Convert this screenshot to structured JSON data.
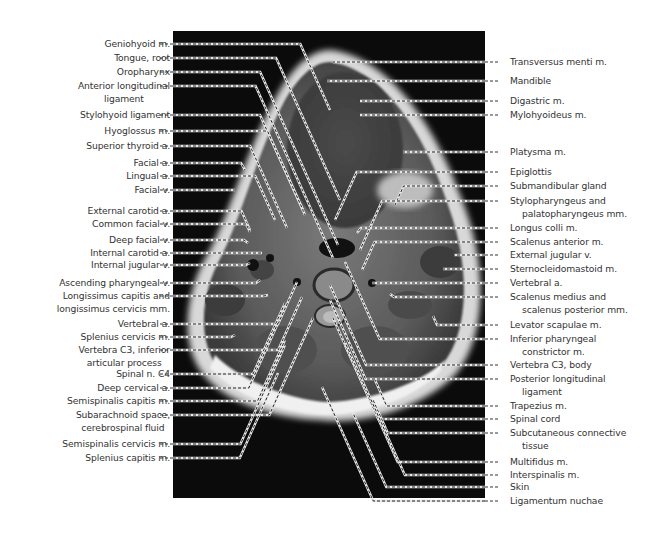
{
  "figure": {
    "colors": {
      "background": "#ffffff",
      "scan_bg": "#0b0b0b",
      "label_text": "#333333",
      "leader_dark": "#222222",
      "leader_light": "#e8e8e8"
    }
  },
  "labels_left": [
    {
      "text": "Geniohyoid m.",
      "line2": "",
      "y": 44,
      "tx": 330,
      "ty": 110
    },
    {
      "text": "Tongue, root",
      "line2": "",
      "y": 58,
      "tx": 340,
      "ty": 200
    },
    {
      "text": "Oropharynx",
      "line2": "",
      "y": 72,
      "tx": 338,
      "ty": 245
    },
    {
      "text": "Anterior longitudinal",
      "line2": "ligament",
      "y": 86,
      "tx": 333,
      "ty": 258
    },
    {
      "text": "Stylohyoid ligament",
      "line2": "",
      "y": 115,
      "tx": 305,
      "ty": 215
    },
    {
      "text": "Hyoglossus m.",
      "line2": "",
      "y": 131,
      "tx": 303,
      "ty": 210
    },
    {
      "text": "Superior thyroid a.",
      "line2": "",
      "y": 146,
      "tx": 287,
      "ty": 228
    },
    {
      "text": "Facial a.",
      "line2": "",
      "y": 163,
      "tx": 245,
      "ty": 170
    },
    {
      "text": "Lingual a.",
      "line2": "",
      "y": 176,
      "tx": 275,
      "ty": 220
    },
    {
      "text": "Facial v.",
      "line2": "",
      "y": 190,
      "tx": 235,
      "ty": 190
    },
    {
      "text": "External carotid a.",
      "line2": "",
      "y": 211,
      "tx": 250,
      "ty": 230
    },
    {
      "text": "Common facial v.",
      "line2": "",
      "y": 224,
      "tx": 250,
      "ty": 232
    },
    {
      "text": "Deep facial v.",
      "line2": "",
      "y": 240,
      "tx": 248,
      "ty": 243
    },
    {
      "text": "Internal carotid a.",
      "line2": "",
      "y": 253,
      "tx": 262,
      "ty": 253
    },
    {
      "text": "Internal jugular v.",
      "line2": "",
      "y": 265,
      "tx": 250,
      "ty": 263
    },
    {
      "text": "Ascending pharyngeal v.",
      "line2": "",
      "y": 283,
      "tx": 260,
      "ty": 280
    },
    {
      "text": "Longissimus capitis and",
      "line2": "longissimus cervicis mm.",
      "y": 296,
      "tx": 268,
      "ty": 295
    },
    {
      "text": "Vertebral a.",
      "line2": "",
      "y": 324,
      "tx": 297,
      "ty": 282
    },
    {
      "text": "Splenius cervicis m.",
      "line2": "",
      "y": 337,
      "tx": 235,
      "ty": 335
    },
    {
      "text": "Vertebra C3, inferior",
      "line2": "articular process",
      "y": 350,
      "tx": 302,
      "ty": 297
    },
    {
      "text": "Spinal n. C4",
      "line2": "",
      "y": 374,
      "tx": 285,
      "ty": 303
    },
    {
      "text": "Deep cervical a.",
      "line2": "",
      "y": 388,
      "tx": 278,
      "ty": 323
    },
    {
      "text": "Semispinalis capitis m.",
      "line2": "",
      "y": 401,
      "tx": 285,
      "ty": 340
    },
    {
      "text": "Subarachnoid space,",
      "line2": "cerebrospinal fluid",
      "y": 415,
      "tx": 313,
      "ty": 318
    },
    {
      "text": "Semispinalis cervicis m.",
      "line2": "",
      "y": 444,
      "tx": 285,
      "ty": 345
    },
    {
      "text": "Splenius capitis m.",
      "line2": "",
      "y": 458,
      "tx": 278,
      "ty": 373
    }
  ],
  "labels_right": [
    {
      "text": "Transversus menti m.",
      "line2": "",
      "y": 62,
      "tx": 333,
      "ty": 62
    },
    {
      "text": "Mandible",
      "line2": "",
      "y": 81,
      "tx": 327,
      "ty": 81
    },
    {
      "text": "Digastric m.",
      "line2": "",
      "y": 101,
      "tx": 360,
      "ty": 101
    },
    {
      "text": "Mylohyoideus m.",
      "line2": "",
      "y": 115,
      "tx": 360,
      "ty": 115
    },
    {
      "text": "Platysma m.",
      "line2": "",
      "y": 152,
      "tx": 403,
      "ty": 152
    },
    {
      "text": "Epiglottis",
      "line2": "",
      "y": 172,
      "tx": 335,
      "ty": 220
    },
    {
      "text": "Submandibular gland",
      "line2": "",
      "y": 186,
      "tx": 395,
      "ty": 205
    },
    {
      "text": "Stylopharyngeus and",
      "line2": "palatopharyngeus mm.",
      "y": 201,
      "tx": 360,
      "ty": 250
    },
    {
      "text": "Longus colli m.",
      "line2": "",
      "y": 228,
      "tx": 357,
      "ty": 233
    },
    {
      "text": "Scalenus anterior m.",
      "line2": "",
      "y": 242,
      "tx": 362,
      "ty": 270
    },
    {
      "text": "External jugular v.",
      "line2": "",
      "y": 255,
      "tx": 454,
      "ty": 255
    },
    {
      "text": "Sternocleidomastoid m.",
      "line2": "",
      "y": 269,
      "tx": 443,
      "ty": 269
    },
    {
      "text": "Vertebral a.",
      "line2": "",
      "y": 283,
      "tx": 372,
      "ty": 283
    },
    {
      "text": "Scalenus medius and",
      "line2": "scalenus posterior mm.",
      "y": 297,
      "tx": 390,
      "ty": 294
    },
    {
      "text": "Levator scapulae m.",
      "line2": "",
      "y": 325,
      "tx": 433,
      "ty": 316
    },
    {
      "text": "Inferior pharyngeal",
      "line2": "constrictor m.",
      "y": 339,
      "tx": 345,
      "ty": 262
    },
    {
      "text": "Vertebra C3, body",
      "line2": "",
      "y": 365,
      "tx": 330,
      "ty": 285
    },
    {
      "text": "Posterior longitudinal",
      "line2": "ligament",
      "y": 379,
      "tx": 330,
      "ty": 300
    },
    {
      "text": "Trapezius m.",
      "line2": "",
      "y": 406,
      "tx": 375,
      "ty": 380
    },
    {
      "text": "Spinal cord",
      "line2": "",
      "y": 419,
      "tx": 333,
      "ty": 318
    },
    {
      "text": "Subcutaneous connective",
      "line2": "tissue",
      "y": 433,
      "tx": 373,
      "ty": 400
    },
    {
      "text": "Multifidus m.",
      "line2": "",
      "y": 462,
      "tx": 345,
      "ty": 345
    },
    {
      "text": "Interspinalis m.",
      "line2": "",
      "y": 475,
      "tx": 345,
      "ty": 342
    },
    {
      "text": "Skin",
      "line2": "",
      "y": 487,
      "tx": 353,
      "ty": 413
    },
    {
      "text": "Ligamentum nuchae",
      "line2": "",
      "y": 501,
      "tx": 322,
      "ty": 387
    }
  ]
}
